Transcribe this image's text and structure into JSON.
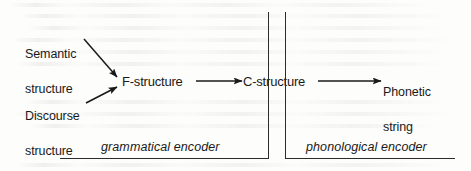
{
  "figure": {
    "background_color": "#fdfdfb",
    "ink_color": "#1a1a1a",
    "width": 471,
    "height": 171
  },
  "inputs": [
    {
      "id": "semantic",
      "line1": "Semantic",
      "line2": "structure"
    },
    {
      "id": "discourse",
      "line1": "Discourse",
      "line2": "structure"
    }
  ],
  "nodes": [
    {
      "id": "f-structure",
      "label": "F-structure"
    },
    {
      "id": "c-structure",
      "label": "C-structure"
    }
  ],
  "output": {
    "id": "phonetic",
    "line1": "Phonetic",
    "line2": "string"
  },
  "stages": [
    {
      "id": "grammatical",
      "label": "grammatical encoder"
    },
    {
      "id": "phonological",
      "label": "phonological encoder"
    }
  ],
  "arrows": [
    {
      "id": "semantic-to-f",
      "from": "Semantic structure",
      "to": "F-structure"
    },
    {
      "id": "discourse-to-f",
      "from": "Discourse structure",
      "to": "F-structure"
    },
    {
      "id": "f-to-c",
      "from": "F-structure",
      "to": "C-structure"
    },
    {
      "id": "c-to-phonetic",
      "from": "C-structure",
      "to": "Phonetic string"
    }
  ]
}
